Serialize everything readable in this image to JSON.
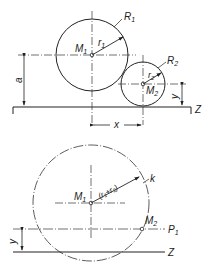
{
  "top_figure": {
    "circle1": {
      "center_label": "M",
      "center_sub": "1",
      "radius_label": "r",
      "radius_sub": "1",
      "outline_label": "R",
      "outline_sub": "1"
    },
    "circle2": {
      "center_label": "M",
      "center_sub": "2",
      "radius_label": "r",
      "radius_sub": "2",
      "outline_label": "R",
      "outline_sub": "2"
    },
    "dim_a": "a",
    "dim_x": "x",
    "dim_y": "y",
    "line_label": "Z"
  },
  "bottom_figure": {
    "center1": {
      "label": "M",
      "sub": "1"
    },
    "center2": {
      "label": "M",
      "sub": "2"
    },
    "radius_label": "(r₁+r₂)",
    "circle_label": "k",
    "parallel_label": "P",
    "parallel_sub": "1",
    "dim_y": "y",
    "line_label": "Z"
  }
}
